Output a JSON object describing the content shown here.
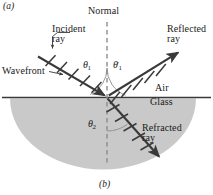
{
  "figure": {
    "panel_top_label": "(a)",
    "panel_bottom_label": "(b)",
    "normal_label": "Normal",
    "incident_label": "Incident\nray",
    "incident_label_line1": "Incident",
    "incident_label_line2": "ray",
    "reflected_label_line1": "Reflected",
    "reflected_label_line2": "ray",
    "refracted_label_line1": "Refracted",
    "refracted_label_line2": "ray",
    "wavefront_label": "Wavefront",
    "medium_upper": "Air",
    "medium_lower": "Glass",
    "angle_incidence": "θ",
    "angle_incidence_sub": "1",
    "angle_reflection": "θ",
    "angle_reflection_sub": "1",
    "angle_reflection_prime": "′",
    "angle_refraction": "θ",
    "angle_refraction_sub": "2",
    "colors": {
      "ray_stroke": "#3a3a3a",
      "glass_fill": "#c9c9c9",
      "interface_line": "#3a3a3a",
      "normal_dash": "#8c8c8c",
      "arc_stroke": "#8c8c8c",
      "text": "#1a1a1a",
      "background": "#ffffff"
    },
    "geometry": {
      "origin_x": 107,
      "origin_y": 97,
      "interface_y": 97,
      "normal_top_y": 22,
      "normal_bottom_y": 166,
      "incident_start_x": 38,
      "incident_start_y": 57,
      "reflected_end_x": 180,
      "reflected_end_y": 51,
      "refracted_end_x": 161,
      "refracted_end_y": 159,
      "glass_center_x": 103,
      "glass_radius_x": 93,
      "glass_radius_y": 71
    }
  }
}
